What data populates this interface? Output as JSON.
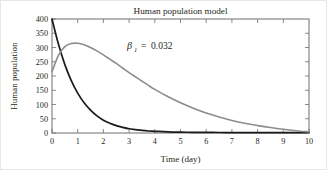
{
  "figure": {
    "background_color": "#ffffff",
    "border_color": "#e8e6e2"
  },
  "chart_data": {
    "type": "line",
    "title": "Human population model",
    "xlabel": "Time (day)",
    "ylabel": "Human population",
    "xlim": [
      0,
      10
    ],
    "ylim": [
      0,
      400
    ],
    "grid": false,
    "legend": null,
    "xticks": [
      "0",
      "1",
      "2",
      "3",
      "4",
      "5",
      "6",
      "7",
      "8",
      "9",
      "10"
    ],
    "yticks": [
      "0",
      "50",
      "100",
      "150",
      "200",
      "250",
      "300",
      "350",
      "400"
    ],
    "annotations": [
      {
        "name": "beta-parameter",
        "symbol": "β",
        "subscript": "1",
        "operator": "=",
        "value": "0.032",
        "text": "β₁ = 0.032",
        "x": 2.9,
        "y": 338
      }
    ],
    "x": [
      0,
      0.25,
      0.5,
      0.75,
      1,
      1.25,
      1.5,
      1.75,
      2,
      2.25,
      2.5,
      2.75,
      3,
      3.25,
      3.5,
      3.75,
      4,
      4.5,
      5,
      5.5,
      6,
      6.5,
      7,
      7.5,
      8,
      8.5,
      9,
      9.5,
      10
    ],
    "series": [
      {
        "name": "susceptible-population",
        "color": "#1a1a1a",
        "style": "solid",
        "values": [
          400,
          312,
          240,
          184,
          140,
          106,
          80,
          60,
          45,
          34,
          26,
          20,
          15,
          12,
          9,
          7,
          6,
          4,
          3,
          2.5,
          2,
          1.8,
          1.5,
          1.3,
          1.2,
          1,
          1,
          1,
          1
        ]
      },
      {
        "name": "infected-population",
        "color": "#8c8c8c",
        "style": "solid",
        "values": [
          215,
          272,
          303,
          314,
          315,
          310,
          300,
          288,
          274,
          259,
          244,
          228,
          212,
          197,
          182,
          167,
          153,
          128,
          106,
          87,
          70,
          56,
          44,
          34,
          26,
          19,
          13,
          8,
          4
        ]
      }
    ]
  }
}
